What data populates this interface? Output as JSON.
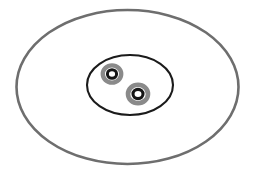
{
  "figure": {
    "background_color": "#ffffff",
    "width": 264,
    "height": 175
  },
  "chart_data": {
    "type": "diagram",
    "shapes": [
      {
        "name": "cell-membrane",
        "label": "Cell membrane",
        "shape": "ellipse",
        "cx": 127.5,
        "cy": 87,
        "rx": 111,
        "ry": 77,
        "stroke": "#6e6e6e",
        "stroke_width": 2.6,
        "fill": "#ffffff"
      },
      {
        "name": "nucleus",
        "label": "Nucleus",
        "shape": "ellipse",
        "cx": 130,
        "cy": 85,
        "rx": 43,
        "ry": 30,
        "stroke": "#1b1b1b",
        "stroke_width": 2.1,
        "fill": "#ffffff"
      },
      {
        "name": "nucleolus-upper-left-halo",
        "label": "Nucleolus halo (upper left)",
        "shape": "ellipse",
        "cx": 112,
        "cy": 74,
        "rx": 9.2,
        "ry": 8.6,
        "stroke": "#8a8a8a",
        "stroke_width": 4.4,
        "fill": "none"
      },
      {
        "name": "nucleolus-upper-left-ring",
        "label": "Nucleolus ring (upper left)",
        "shape": "ellipse",
        "cx": 112,
        "cy": 74,
        "rx": 4.6,
        "ry": 4.3,
        "stroke": "#151515",
        "stroke_width": 3.0,
        "fill": "#ffffff"
      },
      {
        "name": "nucleolus-lower-right-halo",
        "label": "Nucleolus halo (lower right)",
        "shape": "ellipse",
        "cx": 138,
        "cy": 94,
        "rx": 10.0,
        "ry": 9.2,
        "stroke": "#8a8a8a",
        "stroke_width": 4.6,
        "fill": "none"
      },
      {
        "name": "nucleolus-lower-right-ring",
        "label": "Nucleolus ring (lower right)",
        "shape": "ellipse",
        "cx": 138,
        "cy": 94,
        "rx": 5.0,
        "ry": 4.6,
        "stroke": "#151515",
        "stroke_width": 3.1,
        "fill": "#ffffff"
      }
    ],
    "colors": {
      "membrane_stroke": "#6e6e6e",
      "nucleus_stroke": "#1b1b1b",
      "nucleolus_halo": "#8a8a8a",
      "nucleolus_ring": "#151515",
      "background": "#ffffff"
    },
    "labels": [],
    "legend": [],
    "annotations": []
  }
}
